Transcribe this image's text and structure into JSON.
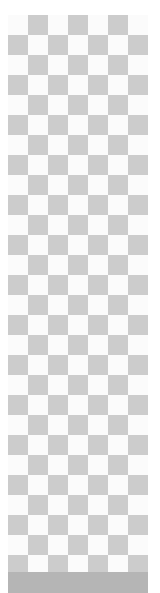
{
  "canvas": {
    "pattern": "transparency-checkerboard",
    "cell_size_px": 20,
    "colors": {
      "light": "#fbfbfb",
      "dark": "#cccccc",
      "bar": "#b5b5b5",
      "background": "#ffffff"
    }
  }
}
